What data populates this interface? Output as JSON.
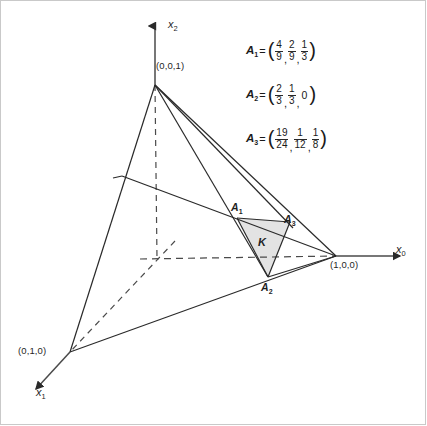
{
  "figure": {
    "background_color": "#ffffff",
    "line_color": "#2a2a2a",
    "shade_color": "#e2e2e2",
    "border_color": "#c9c9c9"
  },
  "axes": [
    {
      "name": "x2-axis",
      "label": "x",
      "sub": "2",
      "direction": "up"
    },
    {
      "name": "x0-axis",
      "label": "x",
      "sub": "0",
      "direction": "right"
    },
    {
      "name": "x1-axis",
      "label": "x",
      "sub": "1",
      "direction": "down-left"
    }
  ],
  "vertices": [
    {
      "name": "vertex-001",
      "label": "(0,0,1)"
    },
    {
      "name": "vertex-100",
      "label": "(1,0,0)"
    },
    {
      "name": "vertex-010",
      "label": "(0,1,0)"
    }
  ],
  "points": [
    {
      "name": "point-a1",
      "label": "A",
      "sub": "1"
    },
    {
      "name": "point-a2",
      "label": "A",
      "sub": "2"
    },
    {
      "name": "point-a3",
      "label": "A",
      "sub": "3"
    }
  ],
  "region": {
    "name": "region-k",
    "label": "K"
  },
  "formulas": [
    {
      "name": "A",
      "sub": "1",
      "eq": "=",
      "open": "(",
      "close": ")",
      "terms": [
        {
          "type": "frac",
          "num": "4",
          "den": "9"
        },
        {
          "type": "frac",
          "num": "2",
          "den": "9"
        },
        {
          "type": "frac",
          "num": "1",
          "den": "3"
        }
      ]
    },
    {
      "name": "A",
      "sub": "2",
      "eq": "=",
      "open": "(",
      "close": ")",
      "terms": [
        {
          "type": "frac",
          "num": "2",
          "den": "3"
        },
        {
          "type": "frac",
          "num": "1",
          "den": "3"
        },
        {
          "type": "int",
          "value": "0"
        }
      ]
    },
    {
      "name": "A",
      "sub": "3",
      "eq": "=",
      "open": "(",
      "close": ")",
      "terms": [
        {
          "type": "frac",
          "num": "19",
          "den": "24"
        },
        {
          "type": "frac",
          "num": "1",
          "den": "12"
        },
        {
          "type": "frac",
          "num": "1",
          "den": "8"
        }
      ]
    }
  ],
  "geometry": {
    "origin": [
      157,
      259
    ],
    "v001": [
      155,
      85
    ],
    "v100": [
      336,
      256
    ],
    "v010": [
      70,
      352
    ],
    "left_node": [
      122,
      176
    ],
    "a1": [
      237,
      218
    ],
    "a2": [
      268,
      277
    ],
    "a3": [
      290,
      222
    ],
    "k_label": [
      262,
      243
    ]
  }
}
